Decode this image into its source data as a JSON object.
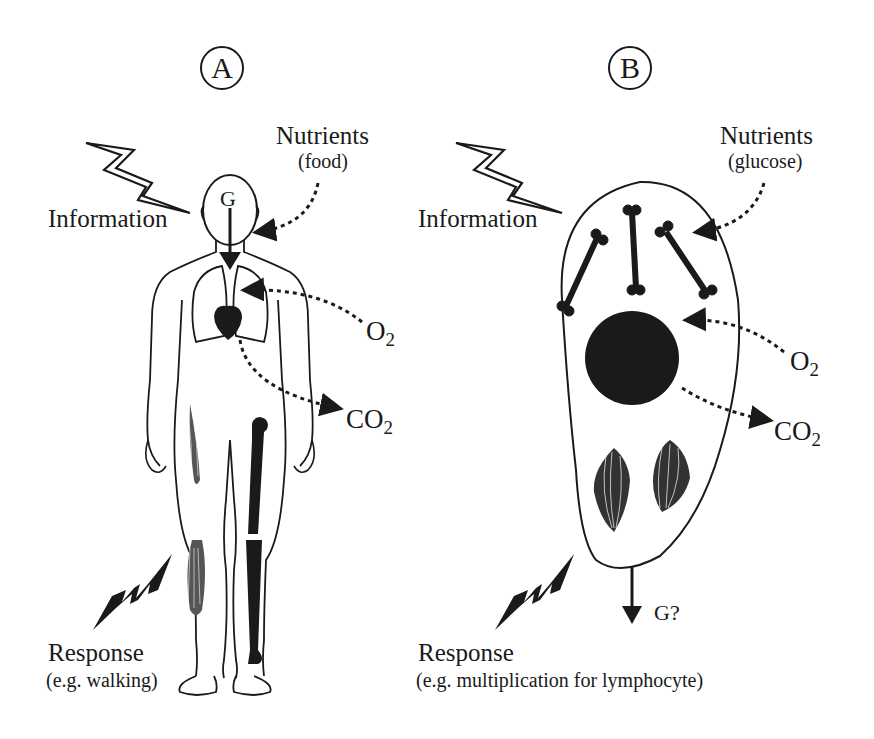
{
  "panels": [
    {
      "id": "A",
      "label": "A",
      "subject": "human body",
      "information": "Information",
      "nutrients": "Nutrients",
      "nutrients_sub": "(food)",
      "o2": "O",
      "o2_sub": "2",
      "co2": "CO",
      "co2_sub": "2",
      "genome": "G",
      "response": "Response",
      "response_sub": "(e.g. walking)"
    },
    {
      "id": "B",
      "label": "B",
      "subject": "cell",
      "information": "Information",
      "nutrients": "Nutrients",
      "nutrients_sub": "(glucose)",
      "o2": "O",
      "o2_sub": "2",
      "co2": "CO",
      "co2_sub": "2",
      "genome": "G?",
      "response": "Response",
      "response_sub": "(e.g. multiplication for lymphocyte)"
    }
  ],
  "colors": {
    "ink": "#1a1a1a",
    "background": "#ffffff"
  }
}
